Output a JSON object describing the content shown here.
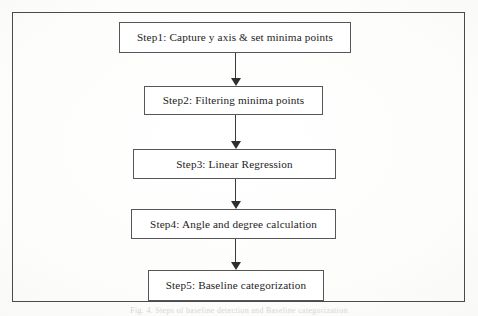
{
  "figure": {
    "kind": "flowchart",
    "orientation": "vertical",
    "caption": "Fig. 4. Steps of baseline detection and Baseline categorization",
    "frame": {
      "border_color": "#4a4a4a",
      "background_color": "#ffffff"
    },
    "style": {
      "box_border_color": "#56565a",
      "box_fill_color": "#ffffff",
      "text_color": "#1d1d1d",
      "arrow_color": "#2e2e2e"
    },
    "steps": [
      {
        "id": "step1",
        "step_number": "Step1",
        "label": "Step1: Capture y axis & set minima points"
      },
      {
        "id": "step2",
        "step_number": "Step2",
        "label": "Step2: Filtering minima points"
      },
      {
        "id": "step3",
        "step_number": "Step3",
        "label": "Step3: Linear Regression"
      },
      {
        "id": "step4",
        "step_number": "Step4",
        "label": "Step4: Angle and degree calculation"
      },
      {
        "id": "step5",
        "step_number": "Step5",
        "label": "Step5: Baseline categorization"
      }
    ],
    "connectors": [
      {
        "id": "arrow-1-2",
        "from": "step1",
        "to": "step2",
        "direction": "down"
      },
      {
        "id": "arrow-2-3",
        "from": "step2",
        "to": "step3",
        "direction": "down"
      },
      {
        "id": "arrow-3-4",
        "from": "step3",
        "to": "step4",
        "direction": "down"
      },
      {
        "id": "arrow-4-5",
        "from": "step4",
        "to": "step5",
        "direction": "down"
      }
    ]
  }
}
